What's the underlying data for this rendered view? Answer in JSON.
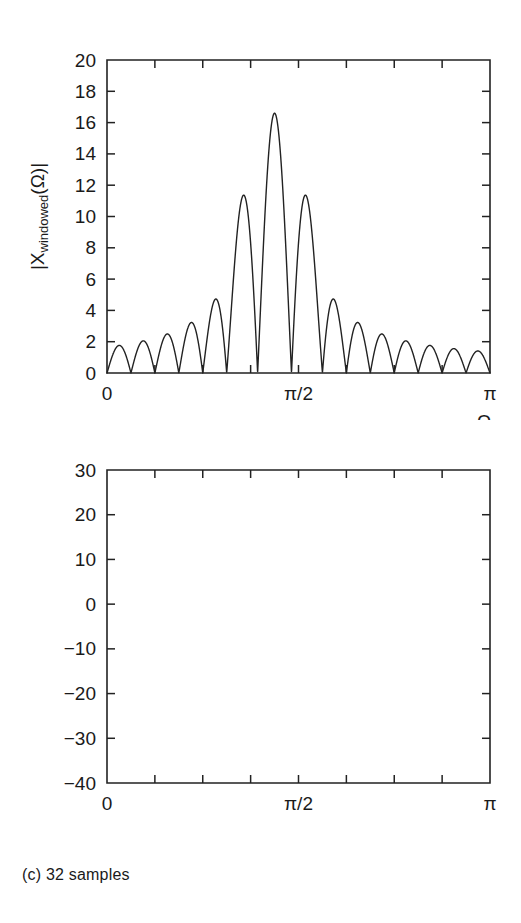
{
  "figure": {
    "caption": "(c) 32 samples",
    "background": "#ffffff",
    "ink": "#222222"
  },
  "chart_data": [
    {
      "id": "magnitude-spectrum",
      "type": "line",
      "title": "",
      "xlabel": "Ω",
      "ylabel": "|X_windowed(Ω)|",
      "ylabel_parts": {
        "pre": "|X",
        "sub": "windowed",
        "post": "(Ω)|"
      },
      "xlim": [
        0,
        3.141592653589793
      ],
      "ylim": [
        0,
        20
      ],
      "yticks": [
        0,
        2,
        4,
        6,
        8,
        10,
        12,
        14,
        16,
        18,
        20
      ],
      "yticklabels": [
        "0",
        "2",
        "4",
        "6",
        "8",
        "10",
        "12",
        "14",
        "16",
        "18",
        "20"
      ],
      "xticks": [
        0,
        1.5707963267948966,
        3.141592653589793
      ],
      "xticklabels": [
        "0",
        "π/2",
        "π"
      ],
      "xminorticks": 8,
      "grid": false,
      "legend": null,
      "series": [
        {
          "name": "|X_windowed|",
          "model": "hann-windowed-sinc",
          "N": 32,
          "center_frequency": 1.3744467859455345,
          "peak_value": 16.6,
          "first_sidelobe_left": 3.5,
          "first_sidelobe_right": 3.1,
          "notes": "Windowed DTFT magnitude of a 32-sample sinusoid; main lobe peaks at 16.6 near 0.4375π."
        }
      ]
    },
    {
      "id": "log-magnitude-spectrum",
      "type": "line",
      "title": "",
      "xlabel": "Ω",
      "ylabel": "20log|X_windowed(Ω)|",
      "ylabel_parts": {
        "pre": "20log|X",
        "sub": "windowed",
        "post": "(Ω)|"
      },
      "xlim": [
        0,
        3.141592653589793
      ],
      "ylim": [
        -40,
        30
      ],
      "yticks": [
        -40,
        -30,
        -20,
        -10,
        0,
        10,
        20,
        30
      ],
      "yticklabels": [
        "−40",
        "−30",
        "−20",
        "−10",
        "0",
        "10",
        "20",
        "30"
      ],
      "xticks": [
        0,
        1.5707963267948966,
        3.141592653589793
      ],
      "xticklabels": [
        "0",
        "π/2",
        "π"
      ],
      "xminorticks": 8,
      "grid": false,
      "legend": null,
      "annotations": [
        {
          "name": "sidelobe-level",
          "text": "13 dB",
          "arrow": "double-headed-vertical",
          "from_value": 11,
          "to_value": 24,
          "at_frequency": 1.1,
          "label_at_frequency": 0.78
        }
      ],
      "series": [
        {
          "name": "20log|X_windowed|",
          "model": "hann-windowed-sinc-db",
          "N": 32,
          "center_frequency": 1.3744467859455345,
          "peak_value": 23.9,
          "first_sidelobe_left": 11,
          "sidelobe_floor": -10,
          "notes": "Decibel version of the magnitude spectrum; main lobe peak 23.9 dB, highest sidelobe 11 dB, i.e. 13 dB below the peak."
        }
      ]
    }
  ]
}
